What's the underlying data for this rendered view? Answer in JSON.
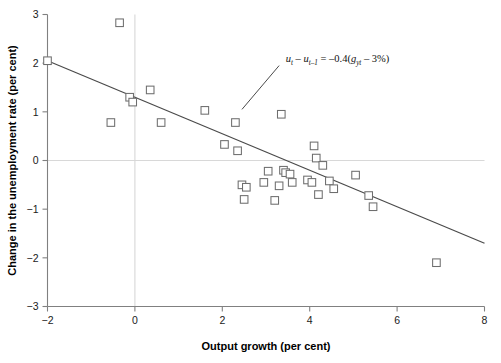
{
  "chart_data": {
    "type": "scatter",
    "title": "",
    "xlabel": "Output growth (per cent)",
    "ylabel": "Change in the unemployment rate (per cent)",
    "xlim": [
      -2,
      8
    ],
    "ylim": [
      -3,
      3
    ],
    "xticks": [
      -2,
      0,
      2,
      4,
      6,
      8
    ],
    "yticks": [
      3,
      2,
      1,
      0,
      -1,
      -2,
      -3
    ],
    "xtick_labels": [
      "−2",
      "0",
      "2",
      "4",
      "6",
      "8"
    ],
    "ytick_labels": [
      "3",
      "2",
      "1",
      "0",
      "−1",
      "−2",
      "−3"
    ],
    "grid": "zero-lines-only",
    "legend": "none",
    "marker": "open-square",
    "marker_color": "#6e6e6e",
    "marker_fill": "#ffffff",
    "line_color": "#4a4a4a",
    "axis_color": "#808080",
    "points": [
      {
        "x": -2.0,
        "y": 2.05
      },
      {
        "x": -0.35,
        "y": 2.83
      },
      {
        "x": -0.55,
        "y": 0.78
      },
      {
        "x": -0.12,
        "y": 1.3
      },
      {
        "x": -0.05,
        "y": 1.2
      },
      {
        "x": 0.35,
        "y": 1.45
      },
      {
        "x": 0.6,
        "y": 0.78
      },
      {
        "x": 1.6,
        "y": 1.03
      },
      {
        "x": 2.05,
        "y": 0.33
      },
      {
        "x": 2.35,
        "y": 0.2
      },
      {
        "x": 2.45,
        "y": -0.5
      },
      {
        "x": 2.55,
        "y": -0.55
      },
      {
        "x": 2.5,
        "y": -0.8
      },
      {
        "x": 2.3,
        "y": 0.78
      },
      {
        "x": 2.95,
        "y": -0.45
      },
      {
        "x": 3.05,
        "y": -0.22
      },
      {
        "x": 3.4,
        "y": -0.2
      },
      {
        "x": 3.45,
        "y": -0.25
      },
      {
        "x": 3.55,
        "y": -0.28
      },
      {
        "x": 3.35,
        "y": 0.95
      },
      {
        "x": 3.3,
        "y": -0.52
      },
      {
        "x": 3.6,
        "y": -0.45
      },
      {
        "x": 3.2,
        "y": -0.82
      },
      {
        "x": 3.95,
        "y": -0.4
      },
      {
        "x": 4.05,
        "y": -0.45
      },
      {
        "x": 4.1,
        "y": 0.3
      },
      {
        "x": 4.15,
        "y": 0.05
      },
      {
        "x": 4.3,
        "y": -0.1
      },
      {
        "x": 4.2,
        "y": -0.7
      },
      {
        "x": 4.45,
        "y": -0.42
      },
      {
        "x": 4.55,
        "y": -0.58
      },
      {
        "x": 5.05,
        "y": -0.3
      },
      {
        "x": 5.35,
        "y": -0.72
      },
      {
        "x": 5.45,
        "y": -0.95
      },
      {
        "x": 6.9,
        "y": -2.1
      }
    ],
    "fit_line": {
      "slope": -0.4,
      "x_start": -2.0,
      "y_start": 2.05,
      "x_end": 8.0,
      "y_end": -1.7
    },
    "annotation": {
      "equation_plain": "u_t − u_{t−1} = −0.4(g_yt − 3%)",
      "lhs_var": "u",
      "lhs_sub": "t",
      "minus": "–",
      "lhs2_var": "u",
      "lhs2_sub": "t–1",
      "equals": "=",
      "coef": "–0.4(",
      "rhs_var": "g",
      "rhs_sub": "yt",
      "rhs_tail": "– 3%)",
      "leader_from_x": 2.45,
      "leader_from_y": 1.05,
      "leader_to_x": 3.3,
      "leader_to_y": 1.95
    }
  }
}
